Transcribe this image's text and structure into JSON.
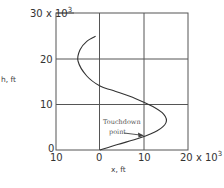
{
  "chart_data": {
    "type": "line",
    "title": "",
    "xlabel": "x, ft",
    "ylabel": "h, ft",
    "xlim": [
      -10000,
      20000
    ],
    "ylim": [
      0,
      30000
    ],
    "grid": true,
    "legend": null,
    "x_ticks": [
      "10",
      "0",
      "10",
      "20 x 10"
    ],
    "x_tick_exponent": "3",
    "y_ticks": [
      "0",
      "10",
      "20",
      "30 x 10"
    ],
    "y_tick_exponent": "3",
    "series": [
      {
        "name": "trajectory",
        "x": [
          0,
          4000,
          9000,
          13000,
          15000,
          14500,
          12000,
          8000,
          3000,
          0,
          -3000,
          -5000,
          -4500,
          -3000,
          -1000
        ],
        "h": [
          0,
          1200,
          2600,
          4200,
          6000,
          7800,
          9500,
          11300,
          13000,
          14000,
          16200,
          19500,
          22000,
          23800,
          24900
        ]
      }
    ],
    "annotations": [
      {
        "text_line1": "Touchdown",
        "text_line2": "point",
        "arrow_to": [
          12000,
          3600
        ]
      }
    ]
  }
}
